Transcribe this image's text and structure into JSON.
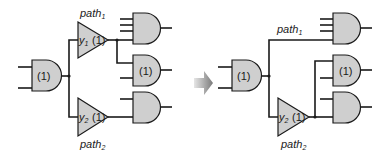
{
  "diagram": {
    "colors": {
      "gate_fill": "#cfcfcf",
      "wire": "#1a1a1a",
      "arrow": "#888888",
      "background": "#ffffff"
    },
    "before": {
      "main_gate_label": "(1)",
      "buffer1": {
        "label_var": "y",
        "label_sub": "1",
        "label_weight": "(1)"
      },
      "buffer2": {
        "label_var": "y",
        "label_sub": "2",
        "label_weight": "(1)"
      },
      "path1_label": {
        "text": "path",
        "sub": "1"
      },
      "path2_label": {
        "text": "path",
        "sub": "2"
      },
      "fanout_gates": [
        {
          "label": "",
          "inputs": 4
        },
        {
          "label": "(1)",
          "inputs": 2
        },
        {
          "label": "",
          "inputs": 2
        }
      ]
    },
    "arrow": {
      "icon": "right-arrow-icon"
    },
    "after": {
      "main_gate_label": "(1)",
      "buffer2": {
        "label_var": "y",
        "label_sub": "2",
        "label_weight": "(1)"
      },
      "path1_label": {
        "text": "path",
        "sub": "1"
      },
      "path2_label": {
        "text": "path",
        "sub": "2"
      },
      "fanout_gates": [
        {
          "label": "",
          "inputs": 4
        },
        {
          "label": "(1)",
          "inputs": 2
        },
        {
          "label": "",
          "inputs": 2
        }
      ]
    }
  }
}
